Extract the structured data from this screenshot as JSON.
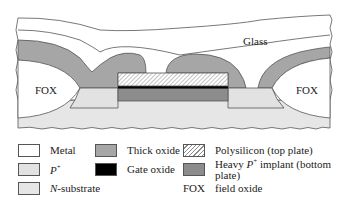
{
  "diagram": {
    "region_labels": {
      "glass": "Glass",
      "fox_left": "FOX",
      "fox_right": "FOX"
    },
    "colors": {
      "metal": "#ffffff",
      "p_plus": "#e2e2e2",
      "n_substrate": "#e6e6e6",
      "thick_oxide": "#a6a6a6",
      "gate_oxide": "#000000",
      "polysilicon_hatch": "#8a8a8a",
      "heavy_p_implant": "#8c8c8c",
      "outline": "#555555"
    }
  },
  "legend": {
    "items": [
      {
        "key": "metal",
        "label": "Metal"
      },
      {
        "key": "p_plus",
        "label_main": "P",
        "label_sup": "+"
      },
      {
        "key": "n_substrate",
        "label_main": "N",
        "label_rest": "-substrate"
      },
      {
        "key": "thick_oxide",
        "label": "Thick oxide"
      },
      {
        "key": "gate_oxide",
        "label": "Gate oxide"
      },
      {
        "key": "polysilicon",
        "label": "Polysilicon (top plate)"
      },
      {
        "key": "heavy_p_implant",
        "label_pre": "Heavy ",
        "label_main": "P",
        "label_sup": "+",
        "label_rest": " implant (bottom plate)"
      },
      {
        "key": "fox",
        "abbr": "FOX",
        "label": "field oxide"
      }
    ]
  }
}
